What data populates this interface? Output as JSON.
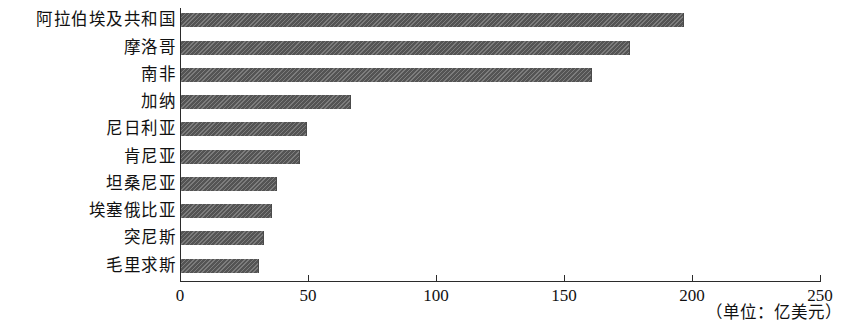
{
  "chart_data": {
    "type": "bar",
    "orientation": "horizontal",
    "title": "",
    "subtitle": "",
    "xlabel": "",
    "ylabel": "",
    "unit_caption": "（单位：亿美元）",
    "categories": [
      "阿拉伯埃及共和国",
      "摩洛哥",
      "南非",
      "加纳",
      "尼日利亚",
      "肯尼亚",
      "坦桑尼亚",
      "埃塞俄比亚",
      "突尼斯",
      "毛里求斯"
    ],
    "values": [
      196,
      175,
      160,
      66,
      49,
      46,
      37,
      35,
      32,
      30
    ],
    "xlim": [
      0,
      250
    ],
    "xticks": [
      0,
      50,
      100,
      150,
      200,
      250
    ],
    "xtick_labels": [
      "0",
      "50",
      "100",
      "150",
      "200",
      "250"
    ],
    "grid": false,
    "legend": false,
    "bar_color": "#595959",
    "axis_color": "#2b2b2b",
    "text_color": "#111111"
  }
}
